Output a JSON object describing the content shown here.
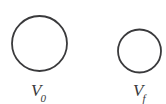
{
  "figure": {
    "type": "diagram",
    "background_color": "#ffffff",
    "stroke_color": "#3a3a3c",
    "text_color": "#3a3a3c",
    "width": 166,
    "height": 104,
    "shapes": [
      {
        "name": "initial-volume-circle",
        "shape": "circle",
        "cx": 39.5,
        "cy": 43.5,
        "r": 27.5,
        "stroke_width": 1.8,
        "fill": "none"
      },
      {
        "name": "final-volume-circle",
        "shape": "circle",
        "cx": 139.5,
        "cy": 51.0,
        "r": 21.5,
        "stroke_width": 1.8,
        "fill": "none"
      }
    ],
    "labels": {
      "initial": {
        "symbol": "V",
        "subscript": "0",
        "full": "V0"
      },
      "final": {
        "symbol": "V",
        "subscript": "f",
        "full": "Vf"
      }
    }
  }
}
